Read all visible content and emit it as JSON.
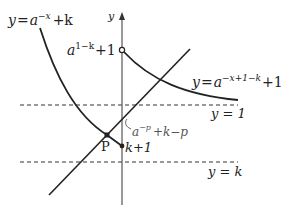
{
  "diagram": {
    "axis": {
      "y_label": "y"
    },
    "labels": {
      "curve1": {
        "y": "y",
        "eq": "=",
        "base": "a",
        "exp": "−x",
        "tail": "+k"
      },
      "curve2": {
        "y": "y",
        "eq": "=",
        "base": "a",
        "exp": "−x+1−k",
        "tail": "+1"
      },
      "open_point": {
        "base": "a",
        "exp": "1−k",
        "tail": "+1"
      },
      "asymptote1": "y = 1",
      "asymptote2": "y = k",
      "point_P": "P",
      "point_k1": "k+1",
      "annotation": {
        "base": "a",
        "exp": "−p",
        "tail": "+k−p"
      }
    },
    "colors": {
      "stroke": "#222222",
      "axis": "#555555",
      "dashed": "#333333"
    }
  }
}
